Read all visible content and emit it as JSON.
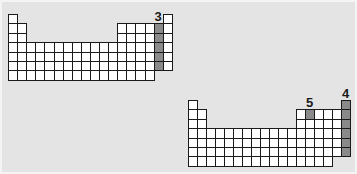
{
  "figure": {
    "background": "#e4e4e4",
    "cell_fill": "#ffffff",
    "highlight_fill": "#8a8a8a",
    "grid_line": "#1a1a1a"
  },
  "tables": [
    {
      "id": "table-1",
      "origin": [
        8,
        14
      ],
      "cell_w": 9.1,
      "cell_h": 9.4,
      "label": "3",
      "label_column": 17,
      "highlight": [
        [
          2,
          17
        ],
        [
          3,
          17
        ],
        [
          4,
          17
        ],
        [
          5,
          17
        ],
        [
          6,
          17
        ]
      ]
    },
    {
      "id": "table-2",
      "origin": [
        188,
        100
      ],
      "cell_w": 9.0,
      "cell_h": 9.4,
      "labels": [
        {
          "text": "5",
          "column": 14
        },
        {
          "text": "4",
          "column": 18
        }
      ],
      "highlight": [
        [
          2,
          14
        ],
        [
          1,
          18
        ],
        [
          2,
          18
        ],
        [
          3,
          18
        ],
        [
          4,
          18
        ],
        [
          5,
          18
        ],
        [
          6,
          18
        ]
      ]
    }
  ],
  "layout_rows": [
    {
      "row": 1,
      "cols": [
        1,
        18
      ]
    },
    {
      "row": 2,
      "cols": [
        1,
        2,
        13,
        14,
        15,
        16,
        17,
        18
      ]
    },
    {
      "row": 3,
      "cols": [
        1,
        2,
        13,
        14,
        15,
        16,
        17,
        18
      ]
    },
    {
      "row": 4,
      "cols": "1-18"
    },
    {
      "row": 5,
      "cols": "1-18"
    },
    {
      "row": 6,
      "cols": "1-18"
    },
    {
      "row": 7,
      "cols": "1-16"
    }
  ]
}
